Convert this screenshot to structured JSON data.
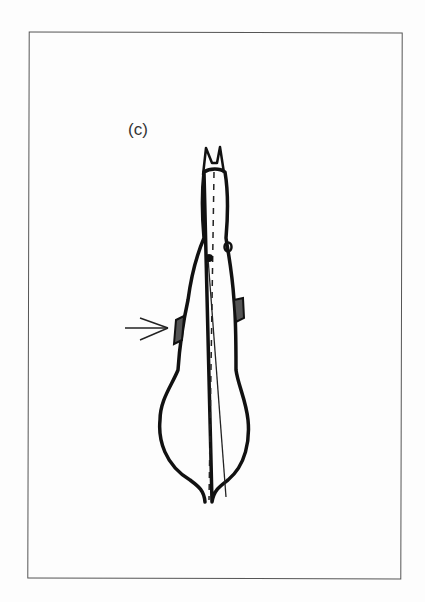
{
  "figure": {
    "label": "(c)",
    "annotations": {
      "arrow": "arrow pointing to left shoulder",
      "center_line": "dashed vertical midline",
      "axis_line": "solid diagonal line from head to tail"
    }
  }
}
